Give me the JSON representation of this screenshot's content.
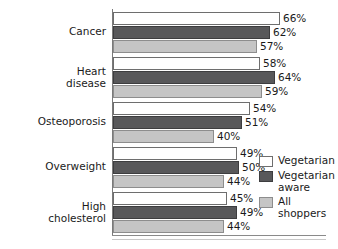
{
  "chart_data": {
    "type": "bar",
    "orientation": "horizontal",
    "title": "",
    "subtitle": "",
    "xlabel": "",
    "ylabel": "",
    "xlim": [
      0,
      70
    ],
    "grid": false,
    "legend_position": "right",
    "value_suffix": "%",
    "categories": [
      "Cancer",
      "Heart\ndisease",
      "Osteoporosis",
      "Overweight",
      "High\ncholesterol"
    ],
    "series": [
      {
        "name": "Vegetarian",
        "color": "#ffffff",
        "border": "#6e6e6e",
        "values": [
          66,
          58,
          54,
          49,
          45
        ],
        "labels": [
          "66%",
          "58%",
          "54%",
          "49%",
          "45%"
        ]
      },
      {
        "name": "Vegetarian\naware",
        "color": "#58585a",
        "border": "#3d3d3f",
        "values": [
          62,
          64,
          51,
          50,
          49
        ],
        "labels": [
          "62%",
          "64%",
          "51%",
          "50%",
          "49%"
        ]
      },
      {
        "name": "All\nshoppers",
        "color": "#c5c5c5",
        "border": "#8d8d8d",
        "values": [
          57,
          59,
          40,
          44,
          44
        ],
        "labels": [
          "57%",
          "59%",
          "40%",
          "44%",
          "44%"
        ]
      }
    ]
  },
  "legend": {
    "items": [
      {
        "label": "Vegetarian"
      },
      {
        "label": "Vegetarian\naware"
      },
      {
        "label": "All\nshoppers"
      }
    ]
  }
}
